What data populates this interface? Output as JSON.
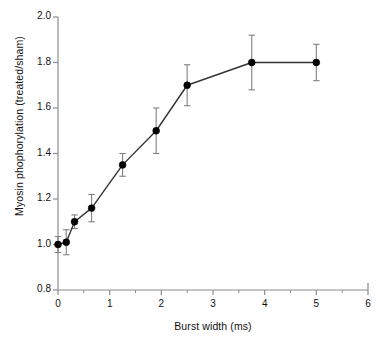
{
  "chart_data": {
    "type": "line",
    "title": "",
    "subtitle": "",
    "xlabel": "Burst width (ms)",
    "ylabel": "Myosin phophorylation (treated/sham)",
    "xlim": [
      0,
      6
    ],
    "ylim": [
      0.8,
      2.0
    ],
    "xticks": [
      0,
      1,
      2,
      3,
      4,
      5,
      6
    ],
    "xticklabels": [
      "0",
      "1",
      "2",
      "3",
      "4",
      "5",
      "6"
    ],
    "xminorticks": [
      0.5,
      1.5,
      2.5,
      3.5,
      4.5,
      5.5
    ],
    "yticks": [
      0.8,
      1.0,
      1.2,
      1.4,
      1.6,
      1.8,
      2.0
    ],
    "yticklabels": [
      "0.8",
      "1.0",
      "1.2",
      "1.4",
      "1.6",
      "1.8",
      "2.0"
    ],
    "grid": false,
    "legend": null,
    "legend_position": "none",
    "marker": "filled-circle",
    "marker_color": "#000000",
    "line_color": "#333333",
    "errorbar_color": "#808080",
    "axis_color": "#8c8c8c",
    "background": "#ffffff",
    "series": [
      {
        "name": "Myosin phosphorylation ratio",
        "x": [
          0.0,
          0.16,
          0.32,
          0.65,
          1.25,
          1.9,
          2.5,
          3.75,
          5.0
        ],
        "values": [
          1.0,
          1.01,
          1.1,
          1.16,
          1.35,
          1.5,
          1.7,
          1.8,
          1.8
        ],
        "yerr": [
          0.035,
          0.055,
          0.03,
          0.06,
          0.05,
          0.1,
          0.09,
          0.12,
          0.08
        ]
      }
    ]
  },
  "figure": {
    "caption": "",
    "note": ""
  }
}
